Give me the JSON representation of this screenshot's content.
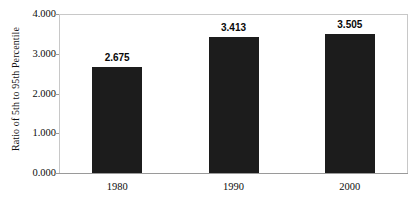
{
  "chart_data": {
    "type": "bar",
    "title": "",
    "subtitle": "",
    "xlabel": "",
    "ylabel": "Ratio of 5th to 95th Percentile",
    "categories": [
      "1980",
      "1990",
      "2000"
    ],
    "values": [
      2.675,
      3.413,
      3.505
    ],
    "value_labels": [
      "2.675",
      "3.413",
      "3.505"
    ],
    "ylim": [
      0,
      4
    ],
    "y_ticks": [
      0,
      1,
      2,
      3,
      4
    ],
    "y_tick_labels": [
      "0.000",
      "1.000",
      "2.000",
      "3.000",
      "4.000"
    ],
    "grid": false,
    "legend": false,
    "legend_position": "none",
    "bar_color": "#1c1c1c",
    "plot_border_color": "#c8c8c8",
    "axis_color": "#9a9a9a",
    "background_color": "#ffffff"
  }
}
